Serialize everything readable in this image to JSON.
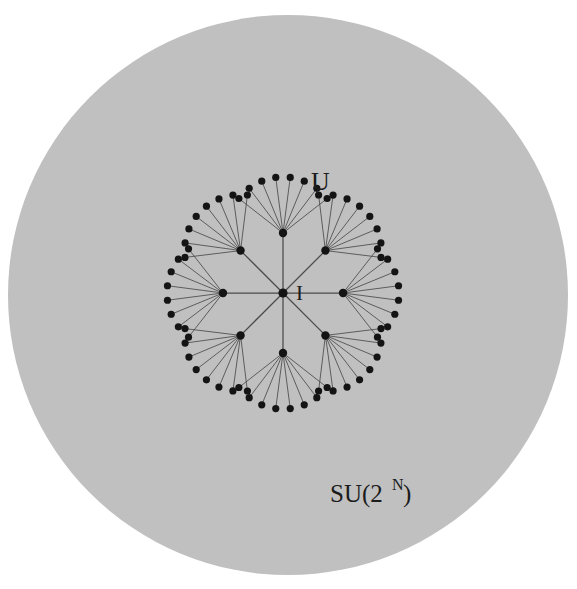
{
  "figure": {
    "name": "su2n-unitary-tree-diagram",
    "caption_labels": {
      "identity": "I",
      "unitary": "U",
      "group_prefix": "SU(2",
      "group_exponent": "N",
      "group_suffix": ")"
    },
    "colors": {
      "page_background": "#ffffff",
      "disk_fill": "#c0c0c0",
      "node_fill": "#141414",
      "edge_stroke": "#4a4a4a",
      "label_color": "#1b1b1b"
    },
    "disk": {
      "cx": 288,
      "cy": 295,
      "r": 280
    },
    "geometry": {
      "root": {
        "x": 283,
        "y": 293,
        "r": 4.6
      },
      "branch_count": 8,
      "branch_angles_deg": [
        -90,
        -45,
        0,
        45,
        90,
        135,
        180,
        -135
      ],
      "level1_radius": 60,
      "level1_node_r": 4.2,
      "leaf_node_r": 3.6,
      "leaf_fan_radius": 56,
      "leaf_fan_spread_deg": 104,
      "leaves_per_branch": 8
    },
    "label_positions": {
      "identity": {
        "x": 296,
        "y": 300,
        "size": 21
      },
      "unitary": {
        "x": 311,
        "y": 190,
        "size": 26
      },
      "group_base": {
        "x": 330,
        "y": 502,
        "size": 25
      },
      "group_exp": {
        "x": 392,
        "y": 490,
        "size": 16
      },
      "group_close": {
        "x": 403,
        "y": 502,
        "size": 25
      }
    }
  },
  "chart_data": {
    "type": "diagram",
    "nodes": {
      "root_label": "I",
      "leaf_example_label": "U",
      "root_degree": 8,
      "level1_count": 8,
      "leaves_per_level1": 8,
      "total_leaves": 64,
      "total_nodes": 73
    },
    "annotations": [
      "I",
      "U",
      "SU(2^N)"
    ]
  }
}
